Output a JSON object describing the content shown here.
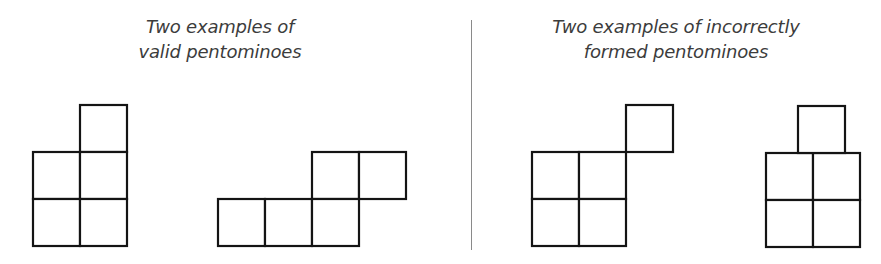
{
  "panels": [
    {
      "title_lines": [
        "Two examples of",
        "valid pentominoes"
      ],
      "category": "valid",
      "shapes": [
        {
          "name": "valid-pentomino-1",
          "cells": [
            [
              1,
              0
            ],
            [
              0,
              1
            ],
            [
              1,
              1
            ],
            [
              0,
              2
            ],
            [
              1,
              2
            ]
          ],
          "origin": [
            33,
            105
          ]
        },
        {
          "name": "valid-pentomino-2",
          "cells": [
            [
              2,
              0
            ],
            [
              3,
              0
            ],
            [
              0,
              1
            ],
            [
              1,
              1
            ],
            [
              2,
              1
            ]
          ],
          "origin": [
            218,
            152
          ]
        }
      ]
    },
    {
      "title_lines": [
        "Two examples of incorrectly",
        "formed pentominoes"
      ],
      "category": "invalid",
      "shapes": [
        {
          "name": "invalid-pentomino-corner-touch",
          "cells": [
            [
              0,
              1
            ],
            [
              1,
              1
            ],
            [
              0,
              2
            ],
            [
              1,
              2
            ]
          ],
          "extra_cells_px": [
            [
              626,
              105
            ]
          ],
          "origin": [
            532,
            105
          ]
        },
        {
          "name": "invalid-pentomino-offset",
          "cells": [
            [
              0,
              1
            ],
            [
              1,
              1
            ],
            [
              0,
              2
            ],
            [
              1,
              2
            ]
          ],
          "extra_cells_px": [
            [
              798,
              106
            ]
          ],
          "origin": [
            766,
            106
          ]
        }
      ]
    }
  ],
  "cell_size": 47,
  "divider": {
    "color": "#8a8a8a"
  },
  "colors": {
    "stroke": "#141414",
    "text": "#3c3c3c",
    "background": "#ffffff"
  }
}
